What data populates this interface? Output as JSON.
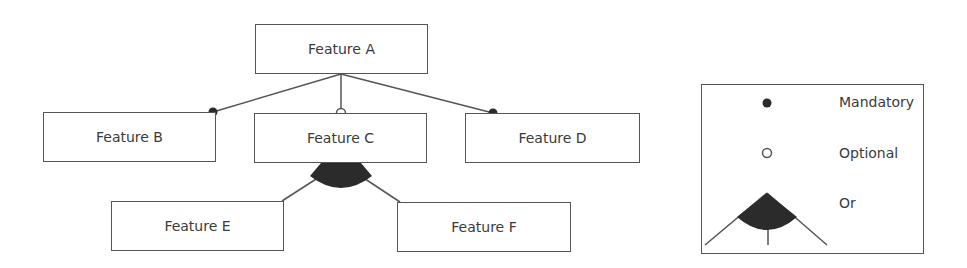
{
  "diagram": {
    "type": "feature-model",
    "nodes": [
      {
        "id": "A",
        "label": "Feature A"
      },
      {
        "id": "B",
        "label": "Feature B"
      },
      {
        "id": "C",
        "label": "Feature C"
      },
      {
        "id": "D",
        "label": "Feature D"
      },
      {
        "id": "E",
        "label": "Feature E"
      },
      {
        "id": "F",
        "label": "Feature F"
      }
    ],
    "edges": [
      {
        "from": "A",
        "to": "B",
        "kind": "mandatory"
      },
      {
        "from": "A",
        "to": "C",
        "kind": "optional"
      },
      {
        "from": "A",
        "to": "D",
        "kind": "mandatory"
      },
      {
        "from": "C",
        "to": "E",
        "kind": "or"
      },
      {
        "from": "C",
        "to": "F",
        "kind": "or"
      }
    ],
    "colors": {
      "line": "#555555",
      "fill": "#2b2b2b",
      "text": "#3a3a3a"
    }
  },
  "legend": {
    "items": [
      {
        "symbol": "filled-circle",
        "label": "Mandatory"
      },
      {
        "symbol": "hollow-circle",
        "label": "Optional"
      },
      {
        "symbol": "filled-arc",
        "label": "Or"
      }
    ]
  }
}
